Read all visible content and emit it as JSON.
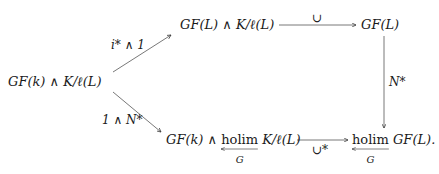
{
  "diagram": {
    "type": "commutative-diagram",
    "nodes": {
      "left": {
        "text": "GF(k) ∧ K/ℓ(L)"
      },
      "top_middle": {
        "text": "GF(L) ∧ K/ℓ(L)"
      },
      "top_right": {
        "text": "GF(L)"
      },
      "bottom_middle": {
        "prefix": "GF(k) ∧ ",
        "holim": "holim",
        "holim_sub": "G",
        "suffix": " K/ℓ(L)"
      },
      "bottom_right": {
        "holim": "holim",
        "holim_sub": "G",
        "suffix": " GF(L)."
      }
    },
    "arrows": [
      {
        "from": "left",
        "to": "top_middle",
        "label": "i* ∧ 1"
      },
      {
        "from": "left",
        "to": "bottom_middle",
        "label": "1 ∧ N*"
      },
      {
        "from": "top_middle",
        "to": "top_right",
        "label": "∪"
      },
      {
        "from": "top_right",
        "to": "bottom_right",
        "label": "N*"
      },
      {
        "from": "bottom_middle",
        "to": "bottom_right",
        "label": "∪*"
      }
    ]
  }
}
